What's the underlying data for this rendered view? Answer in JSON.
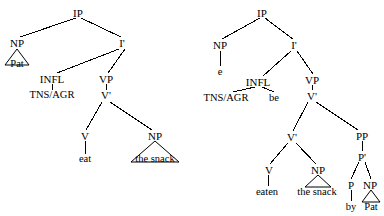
{
  "figure": {
    "type": "syntax-tree-pair"
  },
  "trees": [
    {
      "id": "active-tree",
      "name": "active-clause-tree",
      "sentence": "Pat eat the snack",
      "nodes": [
        {
          "key": "ip",
          "label": "IP",
          "x": 78,
          "y": 13,
          "kind": "category"
        },
        {
          "key": "np_subj",
          "label": "NP",
          "x": 17,
          "y": 43,
          "kind": "category"
        },
        {
          "key": "pat",
          "label": "Pat",
          "x": 17,
          "y": 64,
          "kind": "terminal"
        },
        {
          "key": "ibar",
          "label": "I'",
          "x": 122,
          "y": 43,
          "kind": "category"
        },
        {
          "key": "infl",
          "label": "INFL",
          "x": 52,
          "y": 79,
          "kind": "category"
        },
        {
          "key": "tnsagr",
          "label": "TNS/AGR",
          "x": 52,
          "y": 96,
          "kind": "terminal"
        },
        {
          "key": "vp",
          "label": "VP",
          "x": 106,
          "y": 79,
          "kind": "category"
        },
        {
          "key": "vbar",
          "label": "V'",
          "x": 106,
          "y": 96,
          "kind": "category"
        },
        {
          "key": "v",
          "label": "V",
          "x": 85,
          "y": 136,
          "kind": "category"
        },
        {
          "key": "eat",
          "label": "eat",
          "x": 85,
          "y": 160,
          "kind": "terminal"
        },
        {
          "key": "np_obj",
          "label": "NP",
          "x": 155,
          "y": 136,
          "kind": "category"
        },
        {
          "key": "snack",
          "label": "the snack",
          "x": 155,
          "y": 160,
          "kind": "terminal"
        }
      ]
    },
    {
      "id": "passive-tree",
      "name": "passive-clause-tree",
      "sentence": "e be eaten the snack by Pat",
      "nodes": [
        {
          "key": "ip",
          "label": "IP",
          "x": 262,
          "y": 13,
          "kind": "category"
        },
        {
          "key": "np_subj",
          "label": "NP",
          "x": 220,
          "y": 45,
          "kind": "category"
        },
        {
          "key": "e",
          "label": "e",
          "x": 220,
          "y": 72,
          "kind": "terminal"
        },
        {
          "key": "ibar",
          "label": "I'",
          "x": 294,
          "y": 45,
          "kind": "category"
        },
        {
          "key": "infl",
          "label": "INFL",
          "x": 258,
          "y": 82,
          "kind": "category"
        },
        {
          "key": "tnsagr",
          "label": "TNS/AGR",
          "x": 226,
          "y": 98,
          "kind": "terminal"
        },
        {
          "key": "be",
          "label": "be",
          "x": 274,
          "y": 98,
          "kind": "terminal"
        },
        {
          "key": "vp",
          "label": "VP",
          "x": 312,
          "y": 80,
          "kind": "category"
        },
        {
          "key": "vbar_top",
          "label": "V'",
          "x": 312,
          "y": 96,
          "kind": "category"
        },
        {
          "key": "vbar_low",
          "label": "V'",
          "x": 292,
          "y": 137,
          "kind": "category"
        },
        {
          "key": "pp",
          "label": "PP",
          "x": 362,
          "y": 136,
          "kind": "category"
        },
        {
          "key": "v",
          "label": "V",
          "x": 269,
          "y": 170,
          "kind": "category"
        },
        {
          "key": "eaten",
          "label": "eaten",
          "x": 267,
          "y": 192,
          "kind": "terminal"
        },
        {
          "key": "np_obj",
          "label": "NP",
          "x": 318,
          "y": 170,
          "kind": "category"
        },
        {
          "key": "snack",
          "label": "the snack",
          "x": 317,
          "y": 192,
          "kind": "terminal"
        },
        {
          "key": "pbar",
          "label": "P'",
          "x": 362,
          "y": 157,
          "kind": "category"
        },
        {
          "key": "p",
          "label": "P",
          "x": 351,
          "y": 185,
          "kind": "category"
        },
        {
          "key": "by",
          "label": "by",
          "x": 351,
          "y": 207,
          "kind": "terminal"
        },
        {
          "key": "np_obl",
          "label": "NP",
          "x": 370,
          "y": 185,
          "kind": "category"
        },
        {
          "key": "pat",
          "label": "Pat",
          "x": 371,
          "y": 207,
          "kind": "terminal"
        }
      ]
    }
  ],
  "colors": {
    "background": "#ffffff",
    "ink": "#000000"
  }
}
